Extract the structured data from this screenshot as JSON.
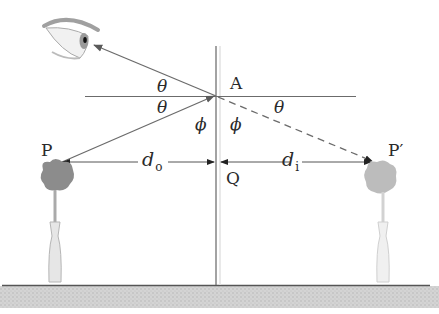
{
  "diagram": {
    "colors": {
      "line": "#6b6b6b",
      "mirror": "#555555",
      "ground": "#c8c8c8",
      "ground_line": "#555555",
      "object": "#8e8e8e",
      "image": "#bdbdbd",
      "text": "#2a2a2a"
    },
    "labels": {
      "point_A": "A",
      "point_P": "P",
      "point_P_image": "P′",
      "point_Q": "Q",
      "theta_upper_left": "θ",
      "theta_lower_left": "θ",
      "theta_right": "θ",
      "phi_left": "ϕ",
      "phi_right": "ϕ",
      "d_object": "d",
      "d_object_sub": "o",
      "d_image": "d",
      "d_image_sub": "i"
    },
    "geometry": {
      "mirror_x": 216,
      "point_A": [
        216,
        96
      ],
      "point_P": [
        62,
        162
      ],
      "point_P_image": [
        372,
        162
      ],
      "eye": [
        92,
        44
      ],
      "ground_y": 285,
      "normal_line": {
        "x1": 85,
        "x2": 356,
        "y": 96
      }
    },
    "icons": {
      "eye": "eye-icon",
      "object": "flower-vase-icon",
      "image": "flower-vase-image-icon"
    }
  }
}
